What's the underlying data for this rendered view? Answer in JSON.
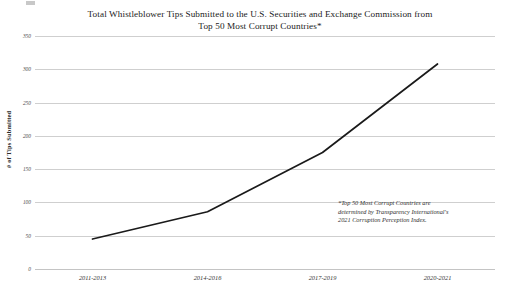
{
  "chart_data": {
    "type": "line",
    "title": "Total Whistleblower Tips Submitted to the U.S. Securities and Exchange Commission from Top 50 Most Corrupt Countries*",
    "title_line1": "Total Whistleblower Tips Submitted to the U.S. Securities and Exchange Commission from",
    "title_line2": "Top 50 Most Corrupt Countries*",
    "categories": [
      "2011-2013",
      "2014-2016",
      "2017-2019",
      "2020-2021"
    ],
    "values": [
      45,
      86,
      175,
      308
    ],
    "series": [
      {
        "name": "# of Tips Submitted",
        "values": [
          45,
          86,
          175,
          308
        ]
      }
    ],
    "xlabel": "",
    "ylabel": "# of Tips Submitted",
    "ylim": [
      0,
      350
    ],
    "ytick_values": [
      0,
      50,
      100,
      150,
      200,
      250,
      300,
      350
    ],
    "ytick_labels": [
      "0",
      "50",
      "100",
      "150",
      "200",
      "250",
      "300",
      "350"
    ],
    "grid": true,
    "grid_axis": "y",
    "legend": false,
    "legend_position": "none",
    "line_color": "#1a1a1a",
    "annotations": [
      {
        "text": "*Top 50 Most Corrupt Countries are determined by Transparency International's 2021 Corruption Perception Index.",
        "line1": "*Top 50 Most Corrupt Countries are",
        "line2": "determined by Transparency International's",
        "line3": "2021 Corruption Perception Index."
      }
    ]
  },
  "colors": {
    "line": "#1a1a1a",
    "grid": "#cfcfcf",
    "text": "#2b2b2b",
    "background": "#ffffff"
  }
}
